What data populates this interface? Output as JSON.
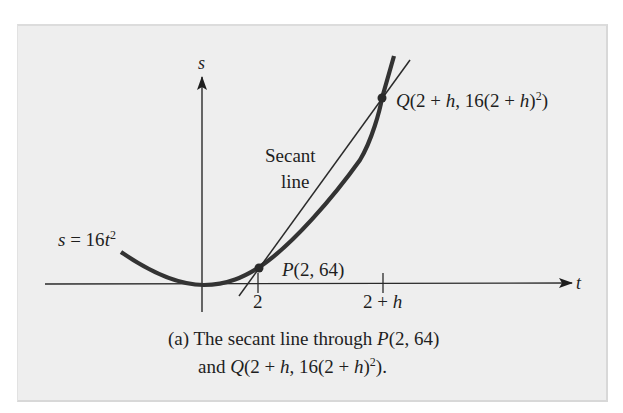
{
  "figure": {
    "axes": {
      "x_label": "t",
      "y_label": "s"
    },
    "curve_label": {
      "lhs": "s",
      "eq": " = 16",
      "var": "t",
      "exp": "2"
    },
    "secant_label": {
      "line1": "Secant",
      "line2": "line"
    },
    "point_p": {
      "name": "P",
      "coords": "(2, 64)"
    },
    "point_q": {
      "name": "Q",
      "pre": "(2 + ",
      "h1": "h",
      "mid": ", 16(2 + ",
      "h2": "h",
      "close": ")",
      "exp": "2",
      "end": ")"
    },
    "ticks": {
      "t1": "2",
      "t2_pre": "2 + ",
      "t2_var": "h"
    },
    "caption": {
      "line1_pre": "(a) The secant line through ",
      "line1_p": "P",
      "line1_post": "(2, 64)",
      "line2_pre": "and ",
      "line2_q": "Q",
      "line2_a": "(2 + ",
      "line2_h1": "h",
      "line2_b": ", 16(2 + ",
      "line2_h2": "h",
      "line2_c": ")",
      "line2_exp": "2",
      "line2_end": ")."
    },
    "colors": {
      "panel_bg": "#eeeeee",
      "curve": "#333333",
      "ink": "#1e1e1e"
    }
  }
}
